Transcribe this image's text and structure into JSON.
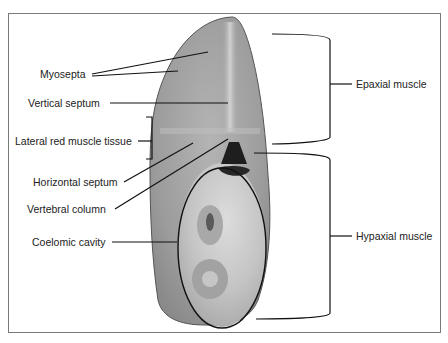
{
  "diagram": {
    "labels_left": [
      {
        "id": "myosepta",
        "text": "Myosepta"
      },
      {
        "id": "vertical-septum",
        "text": "Vertical septum"
      },
      {
        "id": "lateral-red-muscle",
        "text": "Lateral red muscle tissue"
      },
      {
        "id": "horizontal-septum",
        "text": "Horizontal septum"
      },
      {
        "id": "vertebral-column",
        "text": "Vertebral column"
      },
      {
        "id": "coelomic-cavity",
        "text": "Coelomic cavity"
      }
    ],
    "labels_right": [
      {
        "id": "epaxial-muscle",
        "text": "Epaxial muscle"
      },
      {
        "id": "hypaxial-muscle",
        "text": "Hypaxial muscle"
      }
    ],
    "colors": {
      "flesh": "#9a9a9a",
      "flesh_light": "#c8c8c8",
      "outline": "#1a1a1a",
      "frame": "#7a7a7a",
      "vertebra": "#222222"
    }
  }
}
